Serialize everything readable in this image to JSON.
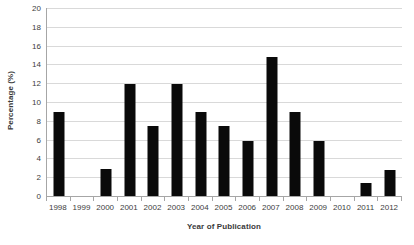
{
  "chart_data": {
    "type": "bar",
    "title": "",
    "subtitle": "",
    "xlabel": "Year of Publication",
    "ylabel": "Percentage (%)",
    "categories": [
      "1998",
      "1999",
      "2000",
      "2001",
      "2002",
      "2003",
      "2004",
      "2005",
      "2006",
      "2007",
      "2008",
      "2009",
      "2010",
      "2011",
      "2012"
    ],
    "values": [
      8.9,
      0,
      2.9,
      11.9,
      7.4,
      11.9,
      8.9,
      7.4,
      5.9,
      14.8,
      8.9,
      5.85,
      0,
      1.35,
      2.8
    ],
    "ylim": [
      0,
      20
    ],
    "ytick_step": 2,
    "yticks": [
      0,
      2,
      4,
      6,
      8,
      10,
      12,
      14,
      16,
      18,
      20
    ],
    "ytick_labels": [
      "0",
      "2",
      "4",
      "6",
      "8",
      "10",
      "12",
      "14",
      "16",
      "18",
      "20"
    ],
    "grid": true,
    "grid_axis": "y",
    "legend": false,
    "legend_position": "none",
    "bar_color": "#0a0a0a",
    "gridline_color": "#d9d9d9",
    "axis_color": "#a6a6a6",
    "background_color": "#ffffff"
  }
}
